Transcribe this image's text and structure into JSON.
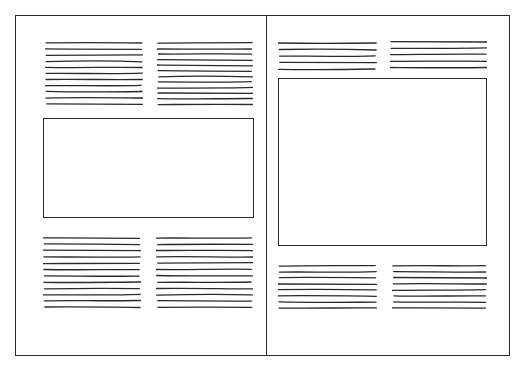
{
  "diagram": {
    "title": "Two-page spread layout sketch",
    "stroke_color": "#2a2a2a",
    "background": "#ffffff",
    "pages": [
      {
        "name": "left-page",
        "blocks": [
          {
            "type": "text-columns",
            "position": "top",
            "columns": [
              {
                "lines": 11
              },
              {
                "lines": 12
              }
            ]
          },
          {
            "type": "image-box",
            "position": "middle",
            "shape": "landscape"
          },
          {
            "type": "text-columns",
            "position": "bottom",
            "columns": [
              {
                "lines": 12
              },
              {
                "lines": 12
              }
            ]
          }
        ]
      },
      {
        "name": "right-page",
        "blocks": [
          {
            "type": "text-columns",
            "position": "top",
            "columns": [
              {
                "lines": 5
              },
              {
                "lines": 5
              }
            ]
          },
          {
            "type": "image-box",
            "position": "middle",
            "shape": "large"
          },
          {
            "type": "text-columns",
            "position": "bottom",
            "columns": [
              {
                "lines": 8
              },
              {
                "lines": 8
              }
            ]
          }
        ]
      }
    ]
  },
  "layout": {
    "columns": [
      {
        "id": "lp-top-a",
        "x": 45,
        "y": 41,
        "w": 98,
        "lines": 11,
        "gap": 6.1
      },
      {
        "id": "lp-top-b",
        "x": 157,
        "y": 41,
        "w": 96,
        "lines": 12,
        "gap": 5.6
      },
      {
        "id": "lp-bot-a",
        "x": 43,
        "y": 236,
        "w": 98,
        "lines": 12,
        "gap": 6.3
      },
      {
        "id": "lp-bot-b",
        "x": 156,
        "y": 236,
        "w": 97,
        "lines": 12,
        "gap": 6.3
      },
      {
        "id": "rp-top-a",
        "x": 278,
        "y": 41,
        "w": 99,
        "lines": 5,
        "gap": 6.6
      },
      {
        "id": "rp-top-b",
        "x": 390,
        "y": 40,
        "w": 97,
        "lines": 5,
        "gap": 6.3
      },
      {
        "id": "rp-bot-a",
        "x": 278,
        "y": 264,
        "w": 99,
        "lines": 8,
        "gap": 6.0
      },
      {
        "id": "rp-bot-b",
        "x": 392,
        "y": 264,
        "w": 95,
        "lines": 8,
        "gap": 6.0
      }
    ],
    "boxes": [
      {
        "id": "lp-image",
        "x": 43,
        "y": 118,
        "w": 211,
        "h": 100
      },
      {
        "id": "rp-image",
        "x": 278,
        "y": 78,
        "w": 209,
        "h": 168
      }
    ]
  }
}
